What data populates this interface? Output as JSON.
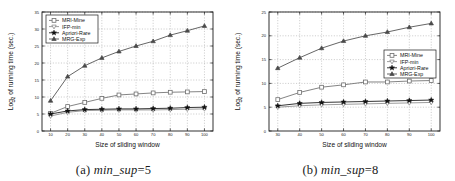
{
  "figure": {
    "panels": [
      {
        "caption_prefix": "(a)",
        "caption_param": "min_sup",
        "caption_value": "=5"
      },
      {
        "caption_prefix": "(b)",
        "caption_param": "min_sup",
        "caption_value": "=8"
      }
    ]
  },
  "colors": {
    "mri_mine": "#6e6e6e",
    "ifp_min": "#8a8a8a",
    "apriori_rare": "#111111",
    "mrg_exp": "#4a4a4a",
    "axis": "#1c1c1c",
    "grid": "#9a9a9a",
    "background": "#ffffff"
  },
  "chart_data": [
    {
      "type": "line",
      "panel": "a",
      "title": "",
      "xlabel": "Size of sliding window",
      "ylabel": "Log2 of running time (sec.)",
      "ylabel_base": "Log",
      "ylabel_sub": "2",
      "ylabel_rest": " of running time (sec.)",
      "x": [
        10,
        20,
        30,
        40,
        50,
        60,
        70,
        80,
        90,
        100
      ],
      "xticks": [
        10,
        20,
        30,
        40,
        50,
        60,
        70,
        80,
        90,
        100
      ],
      "yticks": [
        0,
        5,
        10,
        15,
        20,
        25,
        30,
        35
      ],
      "xlim": [
        5,
        105
      ],
      "ylim": [
        0,
        35
      ],
      "grid": true,
      "legend_position": "top-left",
      "series": [
        {
          "name": "MRI-Mine",
          "marker": "square",
          "color": "#6e6e6e",
          "values": [
            5.2,
            7.2,
            8.4,
            9.6,
            10.6,
            10.9,
            11.2,
            11.4,
            11.5,
            11.6
          ]
        },
        {
          "name": "IFP-min",
          "marker": "triangle-down",
          "color": "#8a8a8a",
          "values": [
            4.4,
            5.5,
            6.0,
            6.1,
            6.2,
            6.2,
            6.2,
            6.3,
            6.4,
            6.5
          ]
        },
        {
          "name": "Apriori-Rare",
          "marker": "star",
          "color": "#111111",
          "values": [
            5.0,
            5.9,
            6.3,
            6.4,
            6.5,
            6.5,
            6.6,
            6.7,
            6.9,
            7.0
          ]
        },
        {
          "name": "MRG-Exp",
          "marker": "triangle-up",
          "color": "#4a4a4a",
          "values": [
            8.9,
            16.0,
            19.2,
            21.5,
            23.4,
            25.0,
            26.4,
            28.2,
            29.5,
            30.9
          ]
        }
      ]
    },
    {
      "type": "line",
      "panel": "b",
      "title": "",
      "xlabel": "Size of sliding window",
      "ylabel": "Log2 of running time (sec.)",
      "ylabel_base": "Log",
      "ylabel_sub": "2",
      "ylabel_rest": " of running time (sec.)",
      "x": [
        30,
        40,
        50,
        60,
        70,
        80,
        90,
        100
      ],
      "xticks": [
        30,
        40,
        50,
        60,
        70,
        80,
        90,
        100
      ],
      "yticks": [
        0,
        5,
        10,
        15,
        20,
        25
      ],
      "xlim": [
        26,
        104
      ],
      "ylim": [
        0,
        25
      ],
      "grid": true,
      "legend_position": "middle-right",
      "series": [
        {
          "name": "MRI-Mine",
          "marker": "square",
          "color": "#6e6e6e",
          "values": [
            6.6,
            8.1,
            9.2,
            9.7,
            10.3,
            10.3,
            10.5,
            10.6
          ]
        },
        {
          "name": "IFP-min",
          "marker": "triangle-down",
          "color": "#8a8a8a",
          "values": [
            5.0,
            5.3,
            5.5,
            5.6,
            5.7,
            5.8,
            5.9,
            6.0
          ]
        },
        {
          "name": "Apriori-Rare",
          "marker": "star",
          "color": "#111111",
          "values": [
            5.3,
            5.8,
            6.0,
            6.1,
            6.2,
            6.3,
            6.4,
            6.5
          ]
        },
        {
          "name": "MRG-Exp",
          "marker": "triangle-up",
          "color": "#4a4a4a",
          "values": [
            13.2,
            15.4,
            17.4,
            18.9,
            20.0,
            20.8,
            21.8,
            22.6
          ]
        }
      ]
    }
  ]
}
